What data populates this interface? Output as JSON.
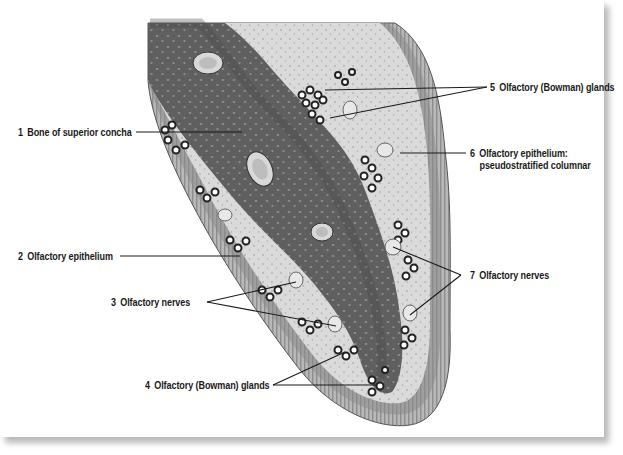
{
  "figure": {
    "colors": {
      "background": "#ffffff",
      "bone": "#5e5e5e",
      "bone_light": "#7a7a7a",
      "lamina_propria": "#d6d6d6",
      "epithelium": "#a9a9a9",
      "label_text": "#1a1a1a",
      "leader_line": "#1a1a1a"
    }
  },
  "labels": [
    {
      "id": 1,
      "num": "1",
      "text": "Bone of superior concha"
    },
    {
      "id": 2,
      "num": "2",
      "text": "Olfactory epithelium"
    },
    {
      "id": 3,
      "num": "3",
      "text": "Olfactory nerves"
    },
    {
      "id": 4,
      "num": "4",
      "text": "Olfactory (Bowman) glands"
    },
    {
      "id": 5,
      "num": "5",
      "text": "Olfactory (Bowman) glands"
    },
    {
      "id": 6,
      "num": "6",
      "text": "Olfactory epithelium:",
      "text2": "pseudostratified columnar"
    },
    {
      "id": 7,
      "num": "7",
      "text": "Olfactory nerves"
    }
  ]
}
